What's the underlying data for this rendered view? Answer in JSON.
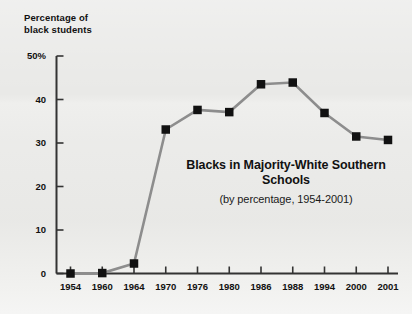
{
  "chart_data": {
    "type": "line",
    "title": "Blacks in Majority-White Southern Schools",
    "subtitle": "(by percentage, 1954-2001)",
    "ylabel_line1": "Percentage of",
    "ylabel_line2": "black students",
    "xlabel": "",
    "categories": [
      "1954",
      "1960",
      "1964",
      "1970",
      "1976",
      "1980",
      "1986",
      "1988",
      "1994",
      "2000",
      "2001"
    ],
    "values": [
      0.0,
      0.1,
      2.3,
      33.1,
      37.6,
      37.1,
      43.5,
      43.9,
      36.9,
      31.5,
      30.7
    ],
    "ytick_labels": [
      "0",
      "10",
      "20",
      "30",
      "40",
      "50%"
    ],
    "ytick_values": [
      0,
      10,
      20,
      30,
      40,
      50
    ],
    "ylim": [
      0,
      50
    ],
    "grid": false,
    "legend": "none",
    "marker": "square",
    "marker_color": "#111111",
    "line_color": "#8d8d8d",
    "axis_color": "#333333",
    "background_color": "#e9e9e7"
  }
}
